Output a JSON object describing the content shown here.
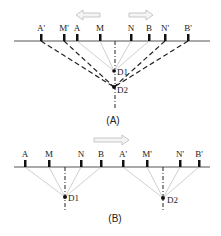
{
  "panel_a": {
    "caption": "(A)",
    "electrodes": [
      {
        "label": "A'",
        "x": 41
      },
      {
        "label": "M'",
        "x": 64
      },
      {
        "label": "A",
        "x": 77
      },
      {
        "label": "M",
        "x": 100
      },
      {
        "label": "N",
        "x": 131
      },
      {
        "label": "B",
        "x": 149
      },
      {
        "label": "N'",
        "x": 165
      },
      {
        "label": "B'",
        "x": 188
      }
    ],
    "points": [
      {
        "label": "D1",
        "x": 114,
        "y": 71
      },
      {
        "label": "D2",
        "x": 114,
        "y": 87
      }
    ],
    "arrows": [
      "left",
      "right"
    ]
  },
  "panel_b": {
    "caption": "(B)",
    "electrodes": [
      {
        "label": "A",
        "x": 25
      },
      {
        "label": "M",
        "x": 49
      },
      {
        "label": "N",
        "x": 81
      },
      {
        "label": "B",
        "x": 101
      },
      {
        "label": "A'",
        "x": 123
      },
      {
        "label": "M'",
        "x": 147
      },
      {
        "label": "N'",
        "x": 180
      },
      {
        "label": "B'",
        "x": 199
      }
    ],
    "points": [
      {
        "label": "D1",
        "x": 65,
        "y": 197
      },
      {
        "label": "D2",
        "x": 163,
        "y": 198
      }
    ],
    "arrows": [
      "right"
    ]
  }
}
